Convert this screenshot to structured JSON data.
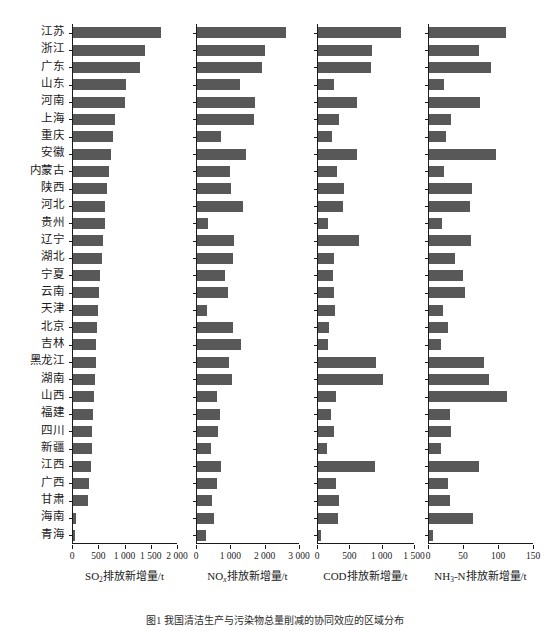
{
  "figure": {
    "caption": "图1  我国清洁生产与污染物总量削减的协同效应的区域分布"
  },
  "chart_data": {
    "type": "bar",
    "title": "我国清洁生产与污染物总量削减的协同效应的区域分布",
    "orientation": "horizontal",
    "grid": false,
    "legend": "none",
    "bar_color": "#585858",
    "categories": [
      "江苏",
      "浙江",
      "广东",
      "山东",
      "河南",
      "上海",
      "重庆",
      "安徽",
      "内蒙古",
      "陕西",
      "河北",
      "贵州",
      "辽宁",
      "湖北",
      "宁夏",
      "云南",
      "天津",
      "北京",
      "吉林",
      "黑龙江",
      "湖南",
      "山西",
      "福建",
      "四川",
      "新疆",
      "江西",
      "广西",
      "甘肃",
      "海南",
      "青海"
    ],
    "panels": [
      {
        "id": "so2",
        "xlabel_html": "SO<sub>2</sub>排放新增量/t",
        "xlabel_text": "SO2排放新增量/t",
        "unit": "t",
        "xlim": [
          0,
          2000
        ],
        "ticks": [
          0,
          500,
          1000,
          1500,
          2000
        ],
        "tick_labels": [
          "0",
          "500",
          "1 000",
          "1 500",
          "2 000"
        ],
        "values": [
          1670,
          1380,
          1270,
          1010,
          990,
          800,
          760,
          720,
          690,
          640,
          610,
          600,
          580,
          560,
          520,
          490,
          470,
          460,
          440,
          430,
          420,
          400,
          390,
          370,
          360,
          340,
          300,
          290,
          60,
          10
        ]
      },
      {
        "id": "nox",
        "xlabel_html": "NO<sub><i>x</i></sub>排放新增量/t",
        "xlabel_text": "NOx排放新增量/t",
        "unit": "t",
        "xlim": [
          0,
          3000
        ],
        "ticks": [
          0,
          1000,
          2000,
          3000
        ],
        "tick_labels": [
          "0",
          "1 000",
          "2 000",
          "3 000"
        ],
        "values": [
          2600,
          1980,
          1900,
          1260,
          1700,
          1660,
          700,
          1430,
          950,
          990,
          1330,
          320,
          1080,
          1050,
          830,
          900,
          300,
          1060,
          1270,
          930,
          1030,
          580,
          660,
          600,
          420,
          710,
          580,
          450,
          500,
          250
        ]
      },
      {
        "id": "cod",
        "xlabel_html": "COD排放新增量/t",
        "xlabel_text": "COD排放新增量/t",
        "unit": "t",
        "xlim": [
          0,
          1500
        ],
        "ticks": [
          0,
          500,
          1000,
          1500
        ],
        "tick_labels": [
          "0",
          "500",
          "1 000",
          "1 500"
        ],
        "values": [
          1290,
          830,
          820,
          250,
          610,
          330,
          210,
          600,
          290,
          400,
          390,
          150,
          640,
          250,
          230,
          250,
          260,
          170,
          160,
          900,
          1010,
          280,
          200,
          250,
          140,
          880,
          280,
          330,
          310,
          45
        ]
      },
      {
        "id": "nh3n",
        "xlabel_html": "NH<sub>3</sub>-N排放新增量/t",
        "xlabel_text": "NH3-N排放新增量/t",
        "unit": "t",
        "xlim": [
          0,
          150
        ],
        "ticks": [
          0,
          50,
          100,
          150
        ],
        "tick_labels": [
          "0",
          "50",
          "100",
          "150"
        ],
        "values": [
          110,
          72,
          88,
          21,
          73,
          32,
          24,
          95,
          22,
          62,
          58,
          18,
          60,
          37,
          48,
          52,
          20,
          27,
          17,
          78,
          86,
          112,
          30,
          32,
          17,
          72,
          27,
          30,
          63,
          5
        ]
      }
    ]
  },
  "layout": {
    "panel_geometry": [
      {
        "left": 72,
        "width": 105
      },
      {
        "left": 196,
        "width": 103
      },
      {
        "left": 317,
        "width": 97
      },
      {
        "left": 428,
        "width": 105
      }
    ],
    "label_col_width": 68,
    "plot_top": 24,
    "plot_height": 520,
    "row_count": 30
  }
}
